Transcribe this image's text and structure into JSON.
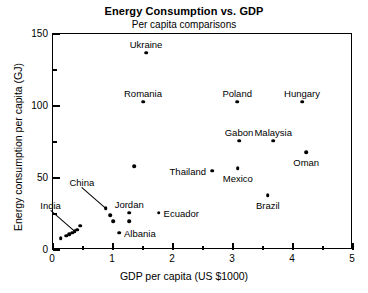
{
  "chart_data": {
    "type": "scatter",
    "title": "Energy Consumption vs. GDP",
    "subtitle": "Per capita comparisons",
    "xlabel": "GDP per capita (US $1000)",
    "ylabel": "Energy consumption per capita (GJ)",
    "xlim": [
      0,
      5
    ],
    "ylim": [
      0,
      150
    ],
    "xticks": [
      "0",
      "1",
      "2",
      "3",
      "4",
      "5"
    ],
    "xtick_values": [
      0,
      1,
      2,
      3,
      4,
      5
    ],
    "xminor_step": 0.5,
    "yticks": [
      "0",
      "50",
      "100",
      "150"
    ],
    "ytick_values": [
      0,
      50,
      100,
      150
    ],
    "yminor_step": 25,
    "grid": false,
    "legend": "none",
    "points": [
      {
        "label": "Ukraine",
        "x": 1.55,
        "y": 137,
        "label_pos": "above"
      },
      {
        "label": "Romania",
        "x": 1.5,
        "y": 103,
        "label_pos": "above"
      },
      {
        "label": "Poland",
        "x": 3.07,
        "y": 103,
        "label_pos": "above"
      },
      {
        "label": "Hungary",
        "x": 4.15,
        "y": 103,
        "label_pos": "above"
      },
      {
        "label": "Gabon",
        "x": 3.1,
        "y": 76,
        "label_pos": "above"
      },
      {
        "label": "Malaysia",
        "x": 3.67,
        "y": 76,
        "label_pos": "above"
      },
      {
        "label": "Oman",
        "x": 4.22,
        "y": 68,
        "label_pos": "below"
      },
      {
        "label": "Mexico",
        "x": 3.08,
        "y": 57,
        "label_pos": "below"
      },
      {
        "label": "Thailand",
        "x": 2.65,
        "y": 55,
        "label_pos": "right"
      },
      {
        "label": "Brazil",
        "x": 3.58,
        "y": 38,
        "label_pos": "below"
      },
      {
        "label": "",
        "x": 1.35,
        "y": 58,
        "label_pos": "none"
      },
      {
        "label": "China",
        "x": 0.88,
        "y": 29,
        "label_pos": "leader-up"
      },
      {
        "label": "Jordan",
        "x": 1.27,
        "y": 26,
        "label_pos": "above"
      },
      {
        "label": "Ecuador",
        "x": 1.76,
        "y": 26,
        "label_pos": "bullet-right"
      },
      {
        "label": "",
        "x": 0.95,
        "y": 24,
        "label_pos": "none"
      },
      {
        "label": "",
        "x": 1.0,
        "y": 20,
        "label_pos": "none"
      },
      {
        "label": "",
        "x": 1.27,
        "y": 20,
        "label_pos": "none"
      },
      {
        "label": "Albania",
        "x": 1.1,
        "y": 12,
        "label_pos": "bullet-right"
      },
      {
        "label": "India",
        "x": 0.36,
        "y": 13,
        "label_pos": "leader-up"
      },
      {
        "label": "",
        "x": 0.45,
        "y": 17,
        "label_pos": "none"
      },
      {
        "label": "",
        "x": 0.4,
        "y": 14,
        "label_pos": "none"
      },
      {
        "label": "",
        "x": 0.32,
        "y": 12,
        "label_pos": "none"
      },
      {
        "label": "",
        "x": 0.27,
        "y": 11,
        "label_pos": "none"
      },
      {
        "label": "",
        "x": 0.22,
        "y": 10,
        "label_pos": "none"
      },
      {
        "label": "",
        "x": 0.13,
        "y": 8,
        "label_pos": "none"
      }
    ]
  }
}
